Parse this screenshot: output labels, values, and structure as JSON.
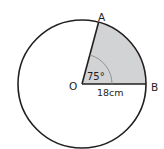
{
  "diagram": {
    "type": "circle-sector",
    "center": {
      "label": "O",
      "x": 82,
      "y": 84
    },
    "radius_px": 64,
    "points": [
      {
        "label": "A",
        "angle_deg": 75
      },
      {
        "label": "B",
        "angle_deg": 0
      }
    ],
    "angle_label": "75°",
    "radius_label": "18cm",
    "colors": {
      "stroke": "#231f20",
      "sector_fill": "#d2d3d5",
      "angle_arc": "#8a8a8c",
      "background": "#ffffff"
    }
  }
}
